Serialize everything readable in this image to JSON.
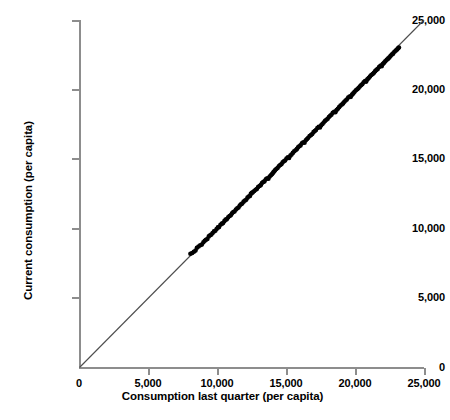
{
  "chart_data": {
    "type": "scatter",
    "title": "",
    "xlabel": "Consumption last quarter (per capita)",
    "ylabel": "Current consumption (per capita)",
    "xlim": [
      0,
      25000
    ],
    "ylim": [
      0,
      25000
    ],
    "xticks": [
      0,
      5000,
      10000,
      15000,
      20000,
      25000
    ],
    "yticks": [
      0,
      5000,
      10000,
      15000,
      20000,
      25000
    ],
    "xtick_labels": [
      "0",
      "5,000",
      "10,000",
      "15,000",
      "20,000",
      "25,000"
    ],
    "ytick_labels": [
      "0",
      "5,000",
      "10,000",
      "15,000",
      "20,000",
      "25,000"
    ],
    "grid": false,
    "legend": false,
    "marker_color": "#000000",
    "marker_shape": "circle",
    "marker_size_px": 4.6,
    "reference_line": {
      "name": "y = x identity line",
      "slope": 1,
      "intercept": 0,
      "from": [
        0,
        0
      ],
      "to": [
        25000,
        25000
      ],
      "color": "#4d4d4d",
      "width_px": 1.1
    },
    "axis_color": "#8d8d8d",
    "series": [
      {
        "name": "Households",
        "points": [
          [
            8050,
            8180
          ],
          [
            8180,
            8240
          ],
          [
            8300,
            8330
          ],
          [
            8420,
            8410
          ],
          [
            8520,
            8620
          ],
          [
            8640,
            8700
          ],
          [
            8760,
            8790
          ],
          [
            8880,
            8840
          ],
          [
            8990,
            9010
          ],
          [
            9090,
            9120
          ],
          [
            9180,
            9190
          ],
          [
            9280,
            9250
          ],
          [
            9380,
            9430
          ],
          [
            9480,
            9510
          ],
          [
            9570,
            9560
          ],
          [
            9660,
            9680
          ],
          [
            9760,
            9790
          ],
          [
            9860,
            9840
          ],
          [
            9950,
            9960
          ],
          [
            10040,
            10080
          ],
          [
            10130,
            10100
          ],
          [
            10230,
            10270
          ],
          [
            10330,
            10350
          ],
          [
            10420,
            10390
          ],
          [
            10510,
            10530
          ],
          [
            10600,
            10640
          ],
          [
            10690,
            10660
          ],
          [
            10790,
            10810
          ],
          [
            10890,
            10900
          ],
          [
            10980,
            10950
          ],
          [
            11070,
            11090
          ],
          [
            11160,
            11180
          ],
          [
            11250,
            11220
          ],
          [
            11350,
            11370
          ],
          [
            11450,
            11450
          ],
          [
            11540,
            11510
          ],
          [
            11630,
            11660
          ],
          [
            11720,
            11740
          ],
          [
            11810,
            11790
          ],
          [
            11910,
            11930
          ],
          [
            12010,
            12010
          ],
          [
            12100,
            12070
          ],
          [
            12190,
            12220
          ],
          [
            12280,
            12300
          ],
          [
            12370,
            12340
          ],
          [
            12430,
            12490
          ],
          [
            12500,
            12560
          ],
          [
            12580,
            12600
          ],
          [
            12680,
            12700
          ],
          [
            12780,
            12790
          ],
          [
            12870,
            12840
          ],
          [
            12960,
            12980
          ],
          [
            13060,
            13060
          ],
          [
            13150,
            13120
          ],
          [
            13240,
            13270
          ],
          [
            13330,
            13350
          ],
          [
            13420,
            13390
          ],
          [
            13520,
            13540
          ],
          [
            13620,
            13620
          ],
          [
            13710,
            13580
          ],
          [
            13800,
            13740
          ],
          [
            13890,
            13830
          ],
          [
            13960,
            13900
          ],
          [
            14020,
            13980
          ],
          [
            14080,
            14060
          ],
          [
            14140,
            14120
          ],
          [
            14200,
            14210
          ],
          [
            14280,
            14280
          ],
          [
            14370,
            14350
          ],
          [
            14460,
            14470
          ],
          [
            14560,
            14570
          ],
          [
            14650,
            14620
          ],
          [
            14740,
            14760
          ],
          [
            14830,
            14840
          ],
          [
            14920,
            14890
          ],
          [
            15020,
            15040
          ],
          [
            15120,
            15120
          ],
          [
            15210,
            15070
          ],
          [
            15300,
            15240
          ],
          [
            15390,
            15320
          ],
          [
            15480,
            15440
          ],
          [
            15580,
            15550
          ],
          [
            15680,
            15630
          ],
          [
            15770,
            15710
          ],
          [
            15860,
            15840
          ],
          [
            15950,
            15920
          ],
          [
            16040,
            15980
          ],
          [
            16140,
            16130
          ],
          [
            16240,
            16210
          ],
          [
            16330,
            16170
          ],
          [
            16420,
            16340
          ],
          [
            16510,
            16430
          ],
          [
            16600,
            16530
          ],
          [
            16700,
            16650
          ],
          [
            16800,
            16730
          ],
          [
            16890,
            16800
          ],
          [
            16980,
            16930
          ],
          [
            17070,
            17010
          ],
          [
            17160,
            17080
          ],
          [
            17260,
            17230
          ],
          [
            17360,
            17310
          ],
          [
            17450,
            17270
          ],
          [
            17540,
            17430
          ],
          [
            17630,
            17520
          ],
          [
            17720,
            17630
          ],
          [
            17820,
            17740
          ],
          [
            17920,
            17820
          ],
          [
            18010,
            17900
          ],
          [
            18100,
            18020
          ],
          [
            18190,
            18110
          ],
          [
            18280,
            18180
          ],
          [
            18380,
            18320
          ],
          [
            18480,
            18400
          ],
          [
            18570,
            18370
          ],
          [
            18660,
            18530
          ],
          [
            18750,
            18620
          ],
          [
            18840,
            18730
          ],
          [
            18940,
            18840
          ],
          [
            19040,
            18920
          ],
          [
            19130,
            19000
          ],
          [
            19220,
            19120
          ],
          [
            19310,
            19210
          ],
          [
            19400,
            19280
          ],
          [
            19500,
            19420
          ],
          [
            19600,
            19500
          ],
          [
            19690,
            19470
          ],
          [
            19780,
            19630
          ],
          [
            19870,
            19720
          ],
          [
            19960,
            19830
          ],
          [
            20060,
            19940
          ],
          [
            20160,
            20020
          ],
          [
            20250,
            20100
          ],
          [
            20340,
            20220
          ],
          [
            20430,
            20310
          ],
          [
            20520,
            20380
          ],
          [
            20620,
            20520
          ],
          [
            20720,
            20600
          ],
          [
            20810,
            20570
          ],
          [
            20900,
            20730
          ],
          [
            20990,
            20820
          ],
          [
            21080,
            20930
          ],
          [
            21180,
            21040
          ],
          [
            21280,
            21120
          ],
          [
            21370,
            21200
          ],
          [
            21460,
            21320
          ],
          [
            21550,
            21410
          ],
          [
            21640,
            21480
          ],
          [
            21740,
            21620
          ],
          [
            21840,
            21700
          ],
          [
            21930,
            21670
          ],
          [
            22020,
            21830
          ],
          [
            22110,
            21920
          ],
          [
            22200,
            22030
          ],
          [
            22300,
            22140
          ],
          [
            22400,
            22220
          ],
          [
            22490,
            22300
          ],
          [
            22580,
            22420
          ],
          [
            22670,
            22510
          ],
          [
            22760,
            22580
          ],
          [
            22860,
            22720
          ],
          [
            22960,
            22800
          ],
          [
            23050,
            22880
          ],
          [
            23120,
            22960
          ],
          [
            23180,
            23020
          ]
        ]
      }
    ]
  }
}
